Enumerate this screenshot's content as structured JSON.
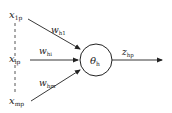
{
  "diagram": {
    "inputs": [
      {
        "symbol": "x",
        "subscript": "1p"
      },
      {
        "symbol": "x",
        "subscript": "ip"
      },
      {
        "symbol": "x",
        "subscript": "mp"
      }
    ],
    "weights": [
      {
        "symbol": "w",
        "subscript": "h1"
      },
      {
        "symbol": "w",
        "subscript": "hi"
      },
      {
        "symbol": "w",
        "subscript": "hm"
      }
    ],
    "node": {
      "symbol": "θ",
      "subscript": "h"
    },
    "output": {
      "symbol": "z",
      "subscript": "hp"
    },
    "colors": {
      "stroke": "#222222",
      "background": "#ffffff"
    }
  }
}
